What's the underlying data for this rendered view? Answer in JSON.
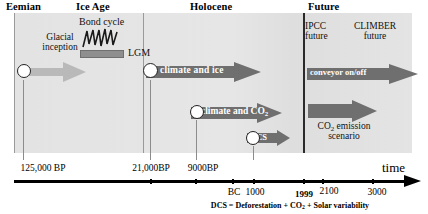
{
  "figure": {
    "type": "timeline-diagram",
    "axis_name": "time",
    "footnote": "DCS = Deforestation + CO2 + Solar variability"
  },
  "eras": [
    {
      "name": "era-eemian",
      "label": "Eemian"
    },
    {
      "name": "era-ice-age",
      "label": "Ice Age"
    },
    {
      "name": "era-holocene",
      "label": "Holocene"
    },
    {
      "name": "era-future",
      "label": "Future"
    }
  ],
  "annotations": {
    "bond_cycle": "Bond cycle",
    "glacial_inception_line1": "Glacial",
    "glacial_inception_line2": "inception",
    "lgm": "LGM",
    "ipcc_future_line1": "IPCC",
    "ipcc_future_line2": "future",
    "climber_future_line1": "CLIMBER",
    "climber_future_line2": "future",
    "co2_emission_line1": "CO2 emission",
    "co2_emission_line2": "scenario"
  },
  "arrows": [
    {
      "name": "arrow-glacial-inception",
      "label": ""
    },
    {
      "name": "arrow-climate-and-ice",
      "label": "climate and ice"
    },
    {
      "name": "arrow-climate-and-co2",
      "label": "climate and CO2"
    },
    {
      "name": "arrow-dcs",
      "label": "DCS"
    },
    {
      "name": "arrow-conveyor",
      "label": "conveyor on/off"
    },
    {
      "name": "arrow-co2-emission",
      "label": ""
    }
  ],
  "axis_ticks": [
    {
      "name": "tick-125000bp",
      "label": "125,000 BP",
      "bold": false
    },
    {
      "name": "tick-21000bp",
      "label": "21,000BP",
      "bold": false
    },
    {
      "name": "tick-9000bp",
      "label": "9000BP",
      "bold": false
    },
    {
      "name": "tick-bc",
      "label": "BC",
      "bold": false
    },
    {
      "name": "tick-1000",
      "label": "1000",
      "bold": false
    },
    {
      "name": "tick-1999",
      "label": "1999",
      "bold": true
    },
    {
      "name": "tick-2100",
      "label": "2100",
      "bold": false
    },
    {
      "name": "tick-3000",
      "label": "3000",
      "bold": false
    }
  ],
  "colors": {
    "band": "#e3e3e3",
    "arrow_dark": "#6f6f6f",
    "arrow_light": "#b9b9b9",
    "axis": "#000000",
    "separator": "#9a9a9a"
  }
}
